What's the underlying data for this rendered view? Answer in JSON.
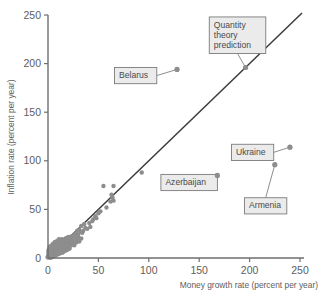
{
  "chart_data": {
    "type": "scatter",
    "title": "",
    "xlabel": "Money growth rate (percent per year)",
    "ylabel": "Inflation rate (percent per year)",
    "xlim": [
      0,
      250
    ],
    "ylim": [
      0,
      250
    ],
    "xticks": [
      0,
      50,
      100,
      150,
      200,
      250
    ],
    "yticks": [
      0,
      50,
      100,
      150,
      200,
      250
    ],
    "xtick_labels": [
      "0",
      "50",
      "100",
      "150",
      "200",
      "250"
    ],
    "ytick_labels": [
      "0",
      "50",
      "100",
      "150",
      "200",
      "250"
    ],
    "grid": false,
    "legend": "none",
    "marker_color": "#8d8d8d",
    "line_color": "#3b3b3b",
    "reference_line": {
      "name": "Quantity theory prediction",
      "description": "45-degree line where inflation equals money growth",
      "slope": 1,
      "intercept": 0,
      "x_start": 0,
      "x_end": 252
    },
    "annotations": [
      {
        "label": "Belarus",
        "x": 128,
        "y": 194,
        "box_x": 66,
        "box_y": 196,
        "lines": [
          "Belarus"
        ]
      },
      {
        "label": "Quantity theory prediction",
        "x": 196,
        "y": 196,
        "box_x": 160,
        "box_y": 248,
        "lines": [
          "Quantity",
          "theory",
          "prediction"
        ]
      },
      {
        "label": "Azerbaijan",
        "x": 168,
        "y": 85,
        "box_x": 112,
        "box_y": 86,
        "lines": [
          "Azerbaijan"
        ]
      },
      {
        "label": "Ukraine",
        "x": 240,
        "y": 114,
        "box_x": 182,
        "box_y": 117,
        "lines": [
          "Ukraine"
        ]
      },
      {
        "label": "Armenia",
        "x": 225,
        "y": 96,
        "box_x": 195,
        "box_y": 62,
        "lines": [
          "Armenia"
        ]
      }
    ],
    "points": [
      [
        128,
        194
      ],
      [
        240,
        114
      ],
      [
        225,
        96
      ],
      [
        168,
        85
      ],
      [
        93,
        88
      ],
      [
        55,
        74
      ],
      [
        65,
        74
      ],
      [
        63,
        65
      ],
      [
        64,
        62
      ],
      [
        65,
        59
      ],
      [
        62,
        58
      ],
      [
        50,
        46
      ],
      [
        47,
        43
      ],
      [
        44,
        38
      ],
      [
        41,
        36
      ],
      [
        36,
        35
      ],
      [
        33,
        33
      ],
      [
        31,
        29
      ],
      [
        32,
        27
      ],
      [
        29,
        28
      ],
      [
        34,
        26
      ],
      [
        30,
        24
      ],
      [
        27,
        25
      ],
      [
        25,
        23
      ],
      [
        28,
        21
      ],
      [
        33,
        20
      ],
      [
        24,
        20
      ],
      [
        22,
        19
      ],
      [
        26,
        18
      ],
      [
        23,
        17
      ],
      [
        31,
        17
      ],
      [
        21,
        16
      ],
      [
        20,
        18
      ],
      [
        19,
        15
      ],
      [
        18,
        17
      ],
      [
        22,
        14
      ],
      [
        17,
        14
      ],
      [
        16,
        16
      ],
      [
        20,
        13
      ],
      [
        15,
        13
      ],
      [
        14,
        15
      ],
      [
        18,
        12
      ],
      [
        13,
        12
      ],
      [
        12,
        14
      ],
      [
        16,
        11
      ],
      [
        11,
        11
      ],
      [
        10,
        13
      ],
      [
        15,
        10
      ],
      [
        9,
        10
      ],
      [
        8,
        12
      ],
      [
        14,
        9
      ],
      [
        7,
        9
      ],
      [
        6,
        11
      ],
      [
        13,
        8
      ],
      [
        5,
        8
      ],
      [
        4,
        10
      ],
      [
        12,
        7
      ],
      [
        3,
        7
      ],
      [
        2,
        9
      ],
      [
        11,
        6
      ],
      [
        1,
        6
      ],
      [
        10,
        5
      ],
      [
        9,
        7
      ],
      [
        8,
        4
      ],
      [
        7,
        6
      ],
      [
        6,
        3
      ],
      [
        5,
        5
      ],
      [
        4,
        2
      ],
      [
        3,
        4
      ],
      [
        2,
        3
      ],
      [
        1,
        2
      ],
      [
        0,
        1
      ],
      [
        2,
        6
      ],
      [
        4,
        7
      ],
      [
        6,
        8
      ],
      [
        8,
        9
      ],
      [
        10,
        10
      ],
      [
        12,
        11
      ],
      [
        14,
        12
      ],
      [
        16,
        13
      ],
      [
        18,
        14
      ],
      [
        3,
        1
      ],
      [
        5,
        2
      ],
      [
        7,
        3
      ],
      [
        9,
        4
      ],
      [
        11,
        5
      ],
      [
        13,
        6
      ],
      [
        15,
        7
      ],
      [
        17,
        8
      ],
      [
        19,
        9
      ],
      [
        21,
        10
      ],
      [
        1,
        4
      ],
      [
        3,
        5
      ],
      [
        5,
        9
      ],
      [
        7,
        11
      ],
      [
        9,
        12
      ],
      [
        11,
        13
      ],
      [
        13,
        14
      ],
      [
        15,
        16
      ],
      [
        17,
        11
      ],
      [
        19,
        12
      ],
      [
        2,
        1
      ],
      [
        4,
        4
      ],
      [
        6,
        5
      ],
      [
        8,
        6
      ],
      [
        10,
        7
      ],
      [
        12,
        9
      ],
      [
        14,
        6
      ],
      [
        16,
        8
      ],
      [
        18,
        9
      ],
      [
        20,
        11
      ],
      [
        1,
        8
      ],
      [
        3,
        9
      ],
      [
        5,
        12
      ],
      [
        7,
        13
      ],
      [
        9,
        14
      ],
      [
        11,
        16
      ],
      [
        13,
        17
      ],
      [
        2,
        11
      ],
      [
        4,
        12
      ],
      [
        6,
        14
      ],
      [
        8,
        15
      ],
      [
        10,
        16
      ],
      [
        12,
        18
      ],
      [
        14,
        19
      ],
      [
        16,
        18
      ],
      [
        5,
        14
      ],
      [
        7,
        16
      ],
      [
        9,
        17
      ],
      [
        11,
        19
      ],
      [
        3,
        12
      ],
      [
        18,
        20
      ],
      [
        20,
        21
      ],
      [
        22,
        22
      ],
      [
        24,
        15
      ],
      [
        26,
        13
      ],
      [
        28,
        16
      ],
      [
        19,
        19
      ],
      [
        21,
        21
      ],
      [
        23,
        13
      ],
      [
        25,
        14
      ],
      [
        27,
        17
      ],
      [
        29,
        19
      ],
      [
        30,
        21
      ],
      [
        35,
        28
      ],
      [
        37,
        31
      ],
      [
        39,
        30
      ],
      [
        42,
        32
      ],
      [
        45,
        40
      ],
      [
        48,
        41
      ],
      [
        52,
        48
      ],
      [
        58,
        52
      ]
    ]
  }
}
